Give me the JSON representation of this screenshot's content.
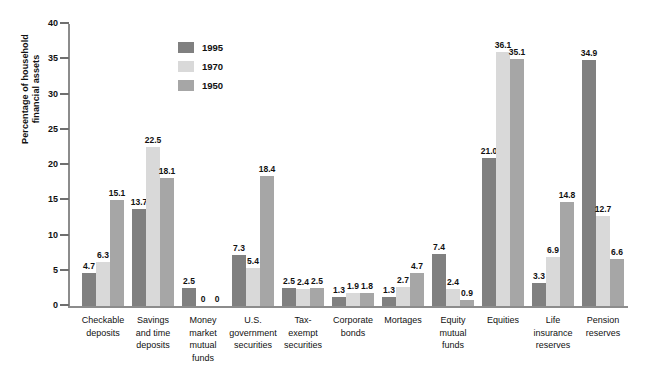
{
  "chart_data": {
    "type": "bar",
    "title": "",
    "xlabel": "",
    "ylabel": "Percentage of household financial assets",
    "ylabel_lines": [
      "Percentage of household",
      "financial assets"
    ],
    "ylim": [
      0,
      40
    ],
    "yticks": [
      0,
      5,
      10,
      15,
      20,
      25,
      30,
      35,
      40
    ],
    "ytick_labels": [
      "0",
      "5",
      "10",
      "15",
      "20",
      "25",
      "30",
      "35",
      "40"
    ],
    "grid": false,
    "legend_position": "upper-left-inside",
    "categories": [
      "Checkable deposits",
      "Savings and time deposits",
      "Money market mutual funds",
      "U.S. government securities",
      "Tax-exempt securities",
      "Corporate bonds",
      "Mortages",
      "Equity mutual funds",
      "Equities",
      "Life insurance reserves",
      "Pension reserves"
    ],
    "category_lines": [
      [
        "Checkable",
        "deposits"
      ],
      [
        "Savings",
        "and time",
        "deposits"
      ],
      [
        "Money",
        "market",
        "mutual",
        "funds"
      ],
      [
        "U.S.",
        "government",
        "securities"
      ],
      [
        "Tax-",
        "exempt",
        "securities"
      ],
      [
        "Corporate",
        "bonds"
      ],
      [
        "Mortages"
      ],
      [
        "Equity",
        "mutual",
        "funds"
      ],
      [
        "Equities"
      ],
      [
        "Life",
        "insurance",
        "reserves"
      ],
      [
        "Pension",
        "reserves"
      ]
    ],
    "series": [
      {
        "name": "1995",
        "color": "#808080",
        "values": [
          4.7,
          13.7,
          2.5,
          7.3,
          2.5,
          1.3,
          1.3,
          7.4,
          21.0,
          3.3,
          34.9
        ],
        "labels": [
          "4.7",
          "13.7",
          "2.5",
          "7.3",
          "2.5",
          "1.3",
          "1.3",
          "7.4",
          "21.0",
          "3.3",
          "34.9"
        ]
      },
      {
        "name": "1970",
        "color": "#d9d9d9",
        "values": [
          6.3,
          22.5,
          0,
          5.4,
          2.4,
          1.9,
          2.7,
          2.4,
          36.1,
          6.9,
          12.7
        ],
        "labels": [
          "6.3",
          "22.5",
          "0",
          "5.4",
          "2.4",
          "1.9",
          "2.7",
          "2.4",
          "36.1",
          "6.9",
          "12.7"
        ]
      },
      {
        "name": "1950",
        "color": "#a6a6a6",
        "values": [
          15.1,
          18.1,
          0,
          18.4,
          2.5,
          1.8,
          4.7,
          0.9,
          35.1,
          14.8,
          6.6
        ],
        "labels": [
          "15.1",
          "18.1",
          "0",
          "18.4",
          "2.5",
          "1.8",
          "4.7",
          "0.9",
          "35.1",
          "14.8",
          "6.6"
        ]
      }
    ],
    "axis_color": "#8c8c8c",
    "background": "#ffffff"
  }
}
